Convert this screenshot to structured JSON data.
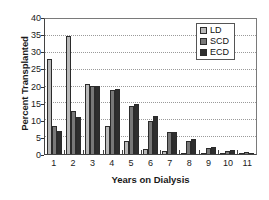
{
  "chart_data": {
    "type": "bar",
    "title": "",
    "xlabel": "Years on Dialysis",
    "ylabel": "Percent Transplanted",
    "categories": [
      "1",
      "2",
      "3",
      "4",
      "5",
      "6",
      "7",
      "8",
      "9",
      "10",
      "11"
    ],
    "ylim": [
      0,
      40
    ],
    "yticks": [
      0,
      5,
      10,
      15,
      20,
      25,
      30,
      35,
      40
    ],
    "ytick_labels": [
      "0",
      "5",
      "10",
      "15",
      "20",
      "25",
      "30",
      "35",
      "40"
    ],
    "grid": "horizontal-dotted",
    "legend_position": "top-right",
    "series": [
      {
        "name": "LD",
        "color": "#b8b8b8",
        "values": [
          27.6,
          34.5,
          20.4,
          8.3,
          3.8,
          1.6,
          0.8,
          0.3,
          0.1,
          0.1,
          0.05
        ]
      },
      {
        "name": "SCD",
        "color": "#787878",
        "values": [
          8.2,
          12.7,
          19.8,
          18.8,
          13.9,
          9.7,
          6.3,
          3.8,
          1.7,
          0.9,
          0.6
        ]
      },
      {
        "name": "ECD",
        "color": "#2e2e2e",
        "values": [
          6.7,
          10.7,
          19.8,
          18.9,
          14.7,
          11.1,
          6.4,
          4.3,
          2.0,
          1.1,
          0.4
        ]
      }
    ]
  }
}
